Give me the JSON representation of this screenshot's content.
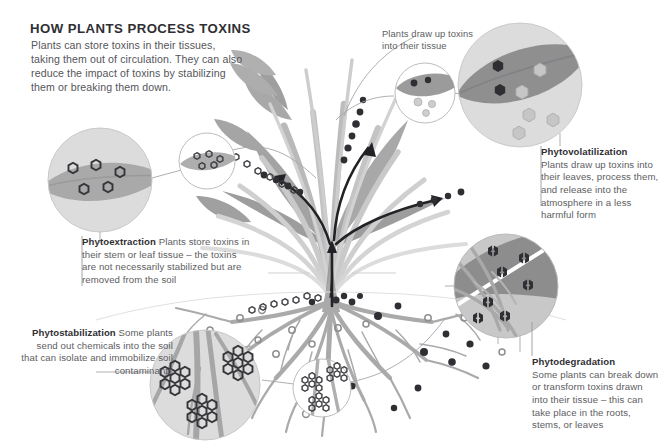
{
  "meta": {
    "background_color": "#ffffff",
    "text_color": "#55555a",
    "heading_color": "#2f2f33",
    "leaf_color": "#9a9a9a",
    "stem_color": "#b4b4b4",
    "dark_circle_color": "#8c8c8c",
    "light_circle_color": "#d9d9d9",
    "toxin_dark": "#3a3a3e",
    "arrow_color": "#222226"
  },
  "title": "HOW PLANTS PROCESS TOXINS",
  "intro": "Plants can store toxins in their tissues, taking them out of circulation. They can also reduce the impact of toxins by stabilizing them or breaking them down.",
  "annotations": {
    "draw_up": "Plants draw up toxins into their tissue"
  },
  "sections": [
    {
      "id": "phytoextraction",
      "heading": "Phytoextraction",
      "body": "Plants store toxins in their stem or leaf tissue – the toxins are not necessarily stabilized but are removed from the soil",
      "align": "left",
      "heading_inline": true
    },
    {
      "id": "phytovolatilization",
      "heading": "Phytovolatilization",
      "body": "Plants draw up toxins into their leaves, process them, and release into the atmosphere in a less harmful form",
      "align": "left",
      "heading_inline": false
    },
    {
      "id": "phytostabilization",
      "heading": "Phytostabilization",
      "body": "Some plants send out chemicals into the soil that can isolate and immobilize soil contaminants",
      "align": "right",
      "heading_inline": true
    },
    {
      "id": "phytodegradation",
      "heading": "Phytodegradation",
      "body": "Some plants can break down or transform toxins drawn into their tissue – this can take place in the roots, stems, or leaves",
      "align": "left",
      "heading_inline": false
    }
  ],
  "detail_circles": [
    {
      "id": "extraction-large",
      "depicts": "leaf cross-section with five hollow hexagon toxin molecules stored in tissue"
    },
    {
      "id": "extraction-small",
      "depicts": "small leaf with clustered hexagon toxin molecules"
    },
    {
      "id": "volatilization-large",
      "depicts": "leaf with dark toxin hexagons inside and pale hexagons released to the air"
    },
    {
      "id": "volatilization-small",
      "depicts": "small leaf with dark toxin dots and pale released dots"
    },
    {
      "id": "degradation-large",
      "depicts": "roots in dark soil with toxin hexagons being broken apart"
    },
    {
      "id": "stabilization-large",
      "depicts": "roots in soil with toxin molecules locked into immobilized clusters"
    },
    {
      "id": "stabilization-small",
      "depicts": "small view of immobilized toxin clusters around roots"
    }
  ]
}
